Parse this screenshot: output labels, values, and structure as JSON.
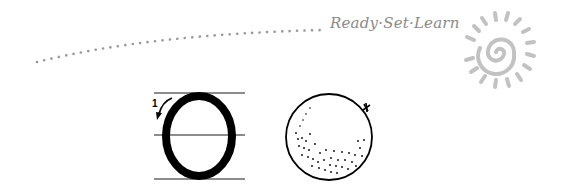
{
  "brand": {
    "text": "Ready·Set·Learn"
  },
  "letter": {
    "glyph": "O",
    "stroke_number": "1"
  },
  "picture": {
    "subject": "orange"
  },
  "colors": {
    "dots": "#999999",
    "brand": "#8a8a8a",
    "ink": "#000000",
    "guide": "#777777",
    "sun": "#c4c4c4"
  }
}
